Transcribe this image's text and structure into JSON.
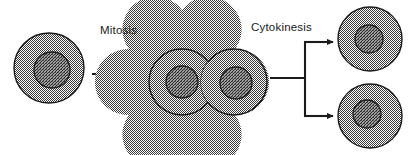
{
  "figure": {
    "background_color": "#ffffff",
    "stroke_color": "#1b1b1b",
    "cytoplasm_fill": "#9a9a9a",
    "nucleus_fill": "#787878",
    "label_color": "#1b1b1b"
  },
  "labels": {
    "mitosis": "Mitosis",
    "cytokinesis": "Cytokinesis"
  },
  "stages": [
    {
      "id": "parent-cell",
      "name": "Parent cell",
      "cx": 49,
      "cy": 68,
      "r": 35,
      "nucleus_r": 18
    },
    {
      "id": "binucleate-cell-left-lobe",
      "name": "Dividing cell left lobe",
      "cx": 182,
      "cy": 82,
      "r": 33,
      "nucleus_r": 16
    },
    {
      "id": "binucleate-cell-right-lobe",
      "name": "Dividing cell right lobe",
      "cx": 234,
      "cy": 82,
      "r": 33,
      "nucleus_r": 16
    },
    {
      "id": "daughter-cell-top",
      "name": "Daughter cell top",
      "cx": 370,
      "cy": 39,
      "r": 32,
      "nucleus_r": 14
    },
    {
      "id": "daughter-cell-bottom",
      "name": "Daughter cell bottom",
      "cx": 370,
      "cy": 116,
      "r": 32,
      "nucleus_r": 14
    }
  ],
  "arrows": [
    {
      "id": "mitosis-arrow",
      "name": "Mitosis arrow",
      "from_x": 92,
      "to_x": 145,
      "y": 74
    },
    {
      "id": "cytokinesis-stem",
      "name": "Cytokinesis split stem",
      "from_x": 270,
      "to_x": 305,
      "y": 78
    },
    {
      "id": "cytokinesis-branch-top",
      "name": "Cytokinesis upper branch arrow",
      "from_x": 305,
      "to_x": 336,
      "y": 42
    },
    {
      "id": "cytokinesis-branch-bottom",
      "name": "Cytokinesis lower branch arrow",
      "from_x": 305,
      "to_x": 336,
      "y": 116
    }
  ],
  "label_positions": {
    "mitosis": {
      "x": 100,
      "y": 34
    },
    "cytokinesis": {
      "x": 251,
      "y": 31
    }
  }
}
